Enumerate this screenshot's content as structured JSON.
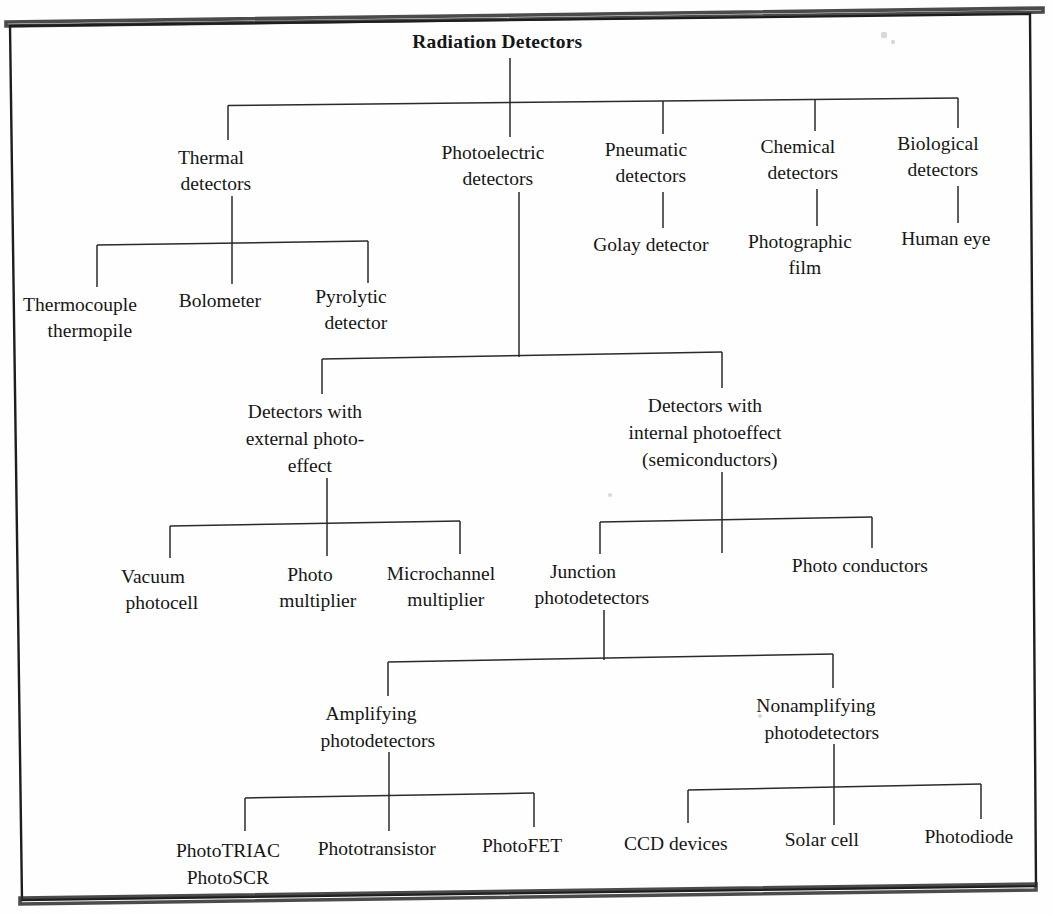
{
  "document": {
    "title": "Radiation Detectors",
    "type": "classification-tree",
    "orientation": "top-down",
    "line_color": "#2a2a2a",
    "text_color": "#161616",
    "background_color": "#fefefe",
    "border_color": "#1d1d1d"
  },
  "tree": {
    "root": {
      "id": "radiation-detectors",
      "label": "Radiation Detectors",
      "bold": true,
      "x": 510,
      "y": 48,
      "lines": [
        "Radiation Detectors"
      ]
    },
    "level1": [
      {
        "id": "thermal-detectors",
        "label": "Thermal detectors",
        "lines": [
          "Thermal",
          "detectors"
        ],
        "x": 228,
        "y": 164
      },
      {
        "id": "photoelectric-detectors",
        "label": "Photoelectric detectors",
        "lines": [
          "Photoelectric",
          "detectors"
        ],
        "x": 510,
        "y": 159
      },
      {
        "id": "pneumatic-detectors",
        "label": "Pneumatic detectors",
        "lines": [
          "Pneumatic",
          "detectors"
        ],
        "x": 663,
        "y": 156
      },
      {
        "id": "chemical-detectors",
        "label": "Chemical detectors",
        "lines": [
          "Chemical",
          "detectors"
        ],
        "x": 815,
        "y": 153
      },
      {
        "id": "biological-detectors",
        "label": "Biological detectors",
        "lines": [
          "Biological",
          "detectors"
        ],
        "x": 955,
        "y": 150
      }
    ],
    "thermal_children": [
      {
        "id": "thermocouple-thermopile",
        "label": "Thermocouple thermopile",
        "lines": [
          "Thermocouple",
          "thermopile"
        ],
        "x": 97,
        "y": 311
      },
      {
        "id": "bolometer",
        "label": "Bolometer",
        "lines": [
          "Bolometer"
        ],
        "x": 232,
        "y": 307
      },
      {
        "id": "pyrolytic-detector",
        "label": "Pyrolytic detector",
        "lines": [
          "Pyrolytic",
          "detector"
        ],
        "x": 368,
        "y": 303
      }
    ],
    "pneumatic_children": [
      {
        "id": "golay-detector",
        "label": "Golay detector",
        "lines": [
          "Golay detector"
        ],
        "x": 663,
        "y": 251
      }
    ],
    "chemical_children": [
      {
        "id": "photographic-film",
        "label": "Photographic film",
        "lines": [
          "Photographic",
          "film"
        ],
        "x": 817,
        "y": 248
      }
    ],
    "biological_children": [
      {
        "id": "human-eye",
        "label": "Human eye",
        "lines": [
          "Human eye"
        ],
        "x": 958,
        "y": 245
      }
    ],
    "photoelectric_children": [
      {
        "id": "external-photoeffect",
        "label": "Detectors with external photo-effect",
        "lines": [
          "Detectors with",
          "external photo-",
          "effect"
        ],
        "x": 322,
        "y": 418
      },
      {
        "id": "internal-photoeffect",
        "label": "Detectors with internal photoeffect (semiconductors)",
        "lines": [
          "Detectors with",
          "internal photoeffect",
          "(semiconductors)"
        ],
        "x": 722,
        "y": 412
      }
    ],
    "external_children": [
      {
        "id": "vacuum-photocell",
        "label": "Vacuum photocell",
        "lines": [
          "Vacuum",
          "photocell"
        ],
        "x": 170,
        "y": 583
      },
      {
        "id": "photo-multiplier",
        "label": "Photo multiplier",
        "lines": [
          "Photo",
          "multiplier"
        ],
        "x": 327,
        "y": 581
      },
      {
        "id": "microchannel-multiplier",
        "label": "Microchannel multiplier",
        "lines": [
          "Microchannel",
          "multiplier"
        ],
        "x": 458,
        "y": 580
      }
    ],
    "internal_children": [
      {
        "id": "junction-photodetectors",
        "label": "Junction photodetectors",
        "lines": [
          "Junction",
          "photodetectors"
        ],
        "x": 600,
        "y": 578
      },
      {
        "id": "photo-conductors",
        "label": "Photo conductors",
        "lines": [
          "Photo conductors"
        ],
        "x": 872,
        "y": 572
      }
    ],
    "junction_children": [
      {
        "id": "amplifying-photodetectors",
        "label": "Amplifying photodetectors",
        "lines": [
          "Amplifying",
          "photodetectors"
        ],
        "x": 388,
        "y": 720
      },
      {
        "id": "nonamplifying-photodetectors",
        "label": "Nonamplifying photodetectors",
        "lines": [
          "Nonamplifying",
          "photodetectors"
        ],
        "x": 833,
        "y": 712
      }
    ],
    "amplifying_children": [
      {
        "id": "phototriac-photoscr",
        "label": "PhotoTRIAC PhotoSCR",
        "lines": [
          "PhotoTRIAC",
          "PhotoSCR"
        ],
        "x": 245,
        "y": 857
      },
      {
        "id": "phototransistor",
        "label": "Phototransistor",
        "lines": [
          "Phototransistor"
        ],
        "x": 389,
        "y": 855
      },
      {
        "id": "photofet",
        "label": "PhotoFET",
        "lines": [
          "PhotoFET"
        ],
        "x": 534,
        "y": 852
      }
    ],
    "nonamplifying_children": [
      {
        "id": "ccd-devices",
        "label": "CCD devices",
        "lines": [
          "CCD devices"
        ],
        "x": 688,
        "y": 850
      },
      {
        "id": "solar-cell",
        "label": "Solar cell",
        "lines": [
          "Solar cell"
        ],
        "x": 834,
        "y": 846
      },
      {
        "id": "photodiode",
        "label": "Photodiode",
        "lines": [
          "Photodiode"
        ],
        "x": 981,
        "y": 843
      }
    ]
  },
  "counts": {
    "total_nodes": 25,
    "levels": 6
  }
}
